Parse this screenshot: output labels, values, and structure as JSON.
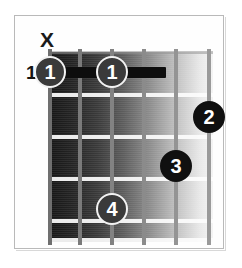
{
  "diagram": {
    "type": "guitar-chord-diagram",
    "mute_marker": "X",
    "mute_marker_string": 1,
    "starting_fret_label": "11",
    "string_count": 6,
    "fret_count": 5,
    "barre": {
      "finger": "1",
      "fret": 1,
      "from_string": 1,
      "to_string": 3,
      "label_left": "1",
      "label_right": "1"
    },
    "fingers": [
      {
        "label": "1",
        "string": 1,
        "fret": 1,
        "style": "ring"
      },
      {
        "label": "1",
        "string": 3,
        "fret": 1,
        "style": "ring"
      },
      {
        "label": "2",
        "string": 6,
        "fret": 2,
        "style": "solid"
      },
      {
        "label": "3",
        "string": 5,
        "fret": 3,
        "style": "solid"
      },
      {
        "label": "4",
        "string": 3,
        "fret": 4,
        "style": "ring"
      }
    ],
    "colors": {
      "board_dark": "#151515",
      "board_light": "#f4f4f4",
      "fret_line": "#fcfcfc",
      "string_line": "#8d8d8d",
      "barre": "#0d0d0d",
      "text": "#141414",
      "page_border": "#b9b9b9"
    }
  }
}
